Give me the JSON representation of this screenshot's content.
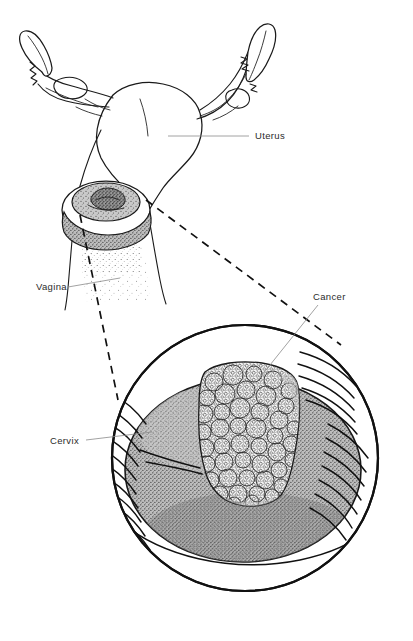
{
  "figure": {
    "background_color": "#ffffff",
    "ink_color": "#111111",
    "tissue_color": "#a8a8a8",
    "tumor_color": "#f2f2f2",
    "width": 413,
    "height": 641
  },
  "labels": {
    "uterus": "Uterus",
    "vagina": "Vagina",
    "cancer": "Cancer",
    "cervix": "Cervix"
  },
  "parts": {
    "uterus_body": "uterus-body",
    "fallopian_tube_left": "fallopian-tube-left",
    "fallopian_tube_right": "fallopian-tube-right",
    "fimbria_left": "fimbria-left",
    "fimbria_right": "fimbria-right",
    "ovary_left": "ovary-left",
    "ovary_right": "ovary-right",
    "cervix_inset": "cervix-small-inset",
    "vaginal_canal": "vaginal-canal",
    "magnified_view": "magnified-cervix-view",
    "tumor_mass": "cancerous-tumor-mass",
    "vaginal_folds": "vaginal-wall-folds"
  }
}
